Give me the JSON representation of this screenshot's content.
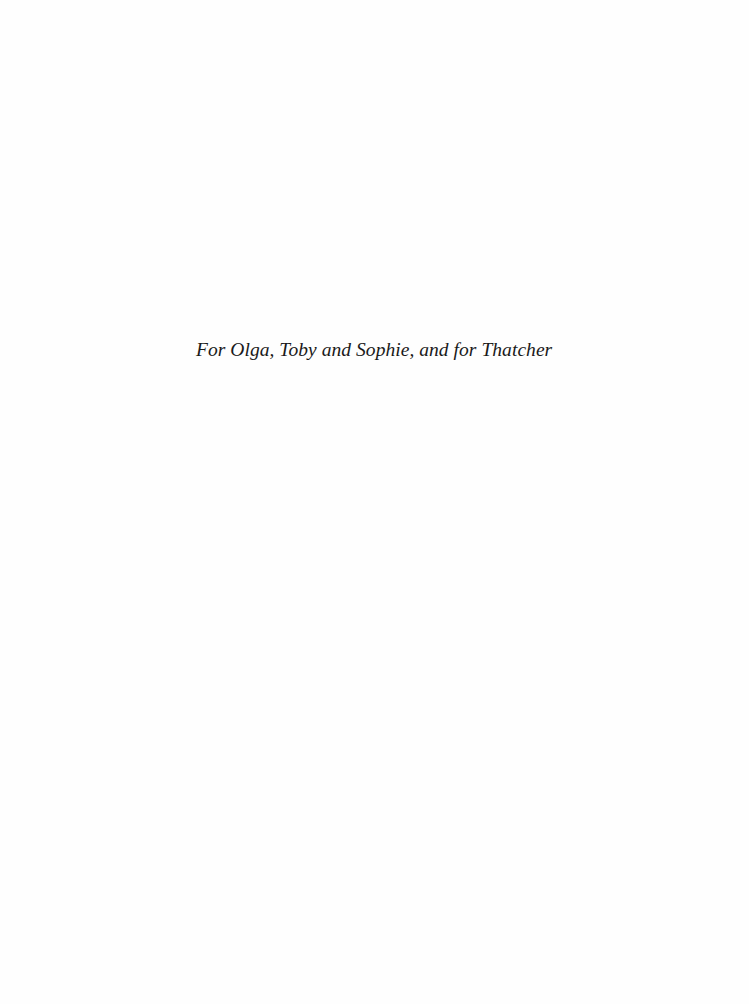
{
  "page": {
    "dedication": "For Olga, Toby and Sophie, and for Thatcher"
  }
}
